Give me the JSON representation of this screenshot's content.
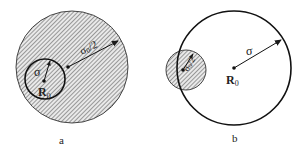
{
  "panels": [
    {
      "id": "a",
      "caption": "a",
      "outer_circle": {
        "cx": 72,
        "cy": 67,
        "r": 56,
        "hatched": true
      },
      "inner_circle": {
        "cx": 45,
        "cy": 79,
        "r": 20,
        "hatched": false
      },
      "labels": {
        "inner_radius": "σ",
        "center": "R",
        "center_sub": "0",
        "outer_radius": "σ",
        "outer_radius_sub": "0",
        "outer_radius_tail": "/2"
      }
    },
    {
      "id": "b",
      "caption": "b",
      "outer_circle": {
        "cx": 234,
        "cy": 68,
        "r": 57,
        "hatched": false
      },
      "inner_circle": {
        "cx": 186,
        "cy": 70,
        "r": 20,
        "hatched": true
      },
      "labels": {
        "outer_radius": "σ",
        "center": "R",
        "center_sub": "0",
        "inner_radius": "σ",
        "inner_radius_sub": "0",
        "inner_radius_tail": "/2"
      }
    }
  ],
  "colors": {
    "stroke": "#1a1a1a",
    "hatch": "#555555",
    "fill": "#e6e6e6"
  }
}
